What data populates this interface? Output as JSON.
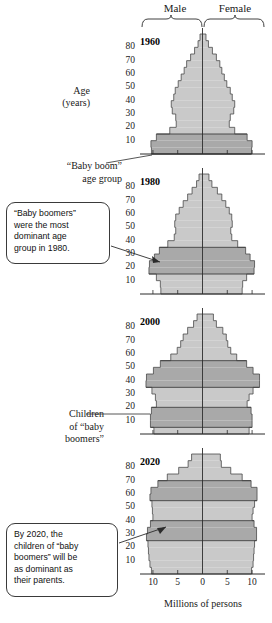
{
  "header": {
    "male_label": "Male",
    "female_label": "Female"
  },
  "axes": {
    "y_title_line1": "Age",
    "y_title_line2": "(years)",
    "y_ticks": [
      "80",
      "70",
      "60",
      "50",
      "40",
      "30",
      "20",
      "10"
    ],
    "x_ticks": [
      "10",
      "5",
      "0",
      "5",
      "10"
    ],
    "x_title": "Millions of persons"
  },
  "annotations": {
    "baby_boom_group": [
      "“Baby boom”",
      "age group"
    ],
    "children_of_boomers": [
      "Children",
      "of “baby",
      "boomers”"
    ]
  },
  "callouts": [
    {
      "id": "callout-1980",
      "lines": [
        "“Baby boomers”",
        "were the most",
        "dominant age",
        "group in 1980."
      ]
    },
    {
      "id": "callout-2020",
      "lines": [
        "By 2020, the",
        "children of “baby",
        "boomers” will be",
        "as dominant as",
        "their parents."
      ]
    }
  ],
  "colors": {
    "fill_light": "#c9c9c9",
    "fill_dark": "#a9a9a9",
    "outline": "#4a4a4a",
    "axis": "#2b2b2b",
    "panel_bg": "#ffffff"
  },
  "chart_data": {
    "type": "bar",
    "xlabel": "Millions of persons",
    "ylabel": "Age (years)",
    "xlim": [
      -12,
      12
    ],
    "ylim": [
      0,
      90
    ],
    "grid": false,
    "legend": [
      "Male",
      "Female"
    ],
    "x_ticks": [
      10,
      5,
      0,
      5,
      10
    ],
    "y_ticks": [
      10,
      20,
      30,
      40,
      50,
      60,
      70,
      80
    ],
    "age_bins": [
      "0-4",
      "5-9",
      "10-14",
      "15-19",
      "20-24",
      "25-29",
      "30-34",
      "35-39",
      "40-44",
      "45-49",
      "50-54",
      "55-59",
      "60-64",
      "65-69",
      "70-74",
      "75-79",
      "80-84",
      "85+"
    ],
    "panels": [
      {
        "year": "1960",
        "highlight_bands": [
          {
            "label": "“Baby boom” age group",
            "age_from": 0,
            "age_to": 15
          }
        ],
        "series": [
          {
            "name": "Male",
            "values": [
              10.3,
              10.4,
              9.3,
              6.6,
              5.3,
              5.4,
              6.1,
              6.3,
              5.8,
              5.5,
              4.9,
              4.3,
              3.7,
              3.2,
              2.4,
              1.6,
              0.9,
              0.5
            ]
          },
          {
            "name": "Female",
            "values": [
              9.9,
              10.0,
              9.0,
              6.5,
              5.4,
              5.6,
              6.3,
              6.5,
              6.0,
              5.6,
              4.9,
              4.4,
              3.9,
              3.5,
              2.8,
              2.0,
              1.2,
              0.7
            ]
          }
        ]
      },
      {
        "year": "1980",
        "highlight_bands": [
          {
            "label": "“Baby boomers”",
            "age_from": 15,
            "age_to": 35
          }
        ],
        "series": [
          {
            "name": "Male",
            "values": [
              8.4,
              8.5,
              9.3,
              10.8,
              10.7,
              9.7,
              8.7,
              7.0,
              5.7,
              5.4,
              5.6,
              5.4,
              4.7,
              3.9,
              3.0,
              2.1,
              1.2,
              0.7
            ]
          },
          {
            "name": "Female",
            "values": [
              8.0,
              8.1,
              8.9,
              10.4,
              10.5,
              9.6,
              8.7,
              7.1,
              5.9,
              5.7,
              6.0,
              5.9,
              5.4,
              4.7,
              3.9,
              3.0,
              1.9,
              1.3
            ]
          }
        ]
      },
      {
        "year": "2000",
        "highlight_bands": [
          {
            "label": "“Baby boomers”",
            "age_from": 35,
            "age_to": 55
          },
          {
            "label": "Children of “baby boomers”",
            "age_from": 5,
            "age_to": 20
          }
        ],
        "series": [
          {
            "name": "Male",
            "values": [
              9.8,
              10.5,
              10.5,
              10.3,
              9.3,
              9.5,
              10.2,
              11.4,
              11.3,
              9.9,
              8.5,
              6.4,
              5.1,
              4.4,
              3.9,
              3.0,
              1.8,
              1.1
            ]
          },
          {
            "name": "Female",
            "values": [
              9.4,
              10.0,
              10.0,
              9.8,
              9.0,
              9.4,
              10.2,
              11.5,
              11.5,
              10.2,
              8.9,
              6.9,
              5.7,
              5.1,
              4.8,
              4.1,
              2.8,
              2.2
            ]
          }
        ]
      },
      {
        "year": "2020",
        "highlight_bands": [
          {
            "label": "Children of “baby boomers”",
            "age_from": 25,
            "age_to": 40
          },
          {
            "label": "“Baby boomers”",
            "age_from": 55,
            "age_to": 70
          }
        ],
        "series": [
          {
            "name": "Male",
            "values": [
              10.3,
              10.6,
              10.8,
              10.9,
              11.0,
              11.3,
              11.1,
              10.5,
              10.0,
              10.1,
              10.2,
              10.6,
              10.4,
              9.0,
              7.1,
              4.8,
              2.9,
              2.2
            ]
          },
          {
            "name": "Female",
            "values": [
              9.9,
              10.2,
              10.3,
              10.4,
              10.5,
              10.9,
              10.9,
              10.4,
              10.0,
              10.2,
              10.5,
              11.0,
              11.0,
              9.8,
              8.0,
              5.7,
              3.8,
              3.6
            ]
          }
        ]
      }
    ]
  }
}
